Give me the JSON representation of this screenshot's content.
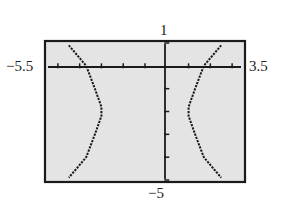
{
  "labels": {
    "ymax": "1",
    "ymin": "−5",
    "xmin": "−5.5",
    "xmax": "3.5"
  },
  "chart_data": {
    "type": "line",
    "title": "",
    "xlabel": "",
    "ylabel": "",
    "xlim": [
      -5.5,
      3.5
    ],
    "ylim": [
      -5,
      1
    ],
    "xscale": 1,
    "yscale": 1,
    "grid": false,
    "style": "graphing calculator window, dotted curve",
    "series": [
      {
        "name": "left branch",
        "x": [
          -4.5,
          -3.7,
          -3.3,
          -3.0,
          -3.0,
          -3.3,
          -3.7,
          -4.5
        ],
        "y": [
          0.9,
          0.0,
          -1.0,
          -1.8,
          -2.2,
          -3.0,
          -4.0,
          -4.9
        ]
      },
      {
        "name": "right branch",
        "x": [
          2.5,
          1.7,
          1.3,
          1.0,
          1.0,
          1.3,
          1.7,
          2.5
        ],
        "y": [
          0.9,
          0.0,
          -1.0,
          -1.8,
          -2.2,
          -3.0,
          -4.0,
          -4.9
        ]
      }
    ]
  }
}
